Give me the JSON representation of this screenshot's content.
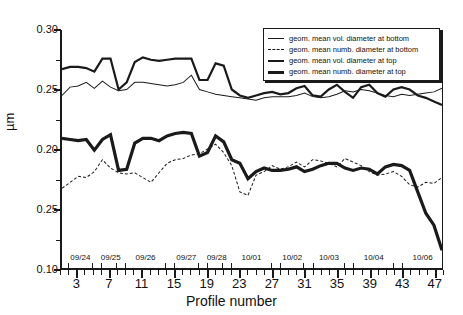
{
  "chart_data": {
    "type": "line",
    "title": "",
    "xlabel": "Profile number",
    "ylabel": "µm",
    "xlim": [
      1,
      48
    ],
    "ylim": [
      0.1,
      0.3
    ],
    "grid": false,
    "legend_position": "top-right",
    "y_ticks": [
      "0.30",
      "0.25",
      "0.20",
      "0.25",
      "0.10"
    ],
    "y_tick_values": [
      0.3,
      0.25,
      0.2,
      0.15,
      0.1
    ],
    "x_ticks": [
      3,
      7,
      11,
      15,
      19,
      23,
      27,
      31,
      35,
      39,
      43,
      47
    ],
    "x": [
      1,
      2,
      3,
      4,
      5,
      6,
      7,
      8,
      9,
      10,
      11,
      12,
      13,
      14,
      15,
      16,
      17,
      18,
      19,
      20,
      21,
      22,
      23,
      24,
      25,
      26,
      27,
      28,
      29,
      30,
      31,
      32,
      33,
      34,
      35,
      36,
      37,
      38,
      39,
      40,
      41,
      42,
      43,
      44,
      45,
      46,
      47,
      48
    ],
    "series": [
      {
        "name": "geom. mean vol. diameter at bottom",
        "style": "thin-solid",
        "color": "#1a1a1a",
        "values": [
          0.245,
          0.252,
          0.253,
          0.256,
          0.251,
          0.257,
          0.252,
          0.249,
          0.25,
          0.256,
          0.256,
          0.255,
          0.254,
          0.253,
          0.254,
          0.256,
          0.262,
          0.25,
          0.248,
          0.246,
          0.245,
          0.244,
          0.243,
          0.242,
          0.241,
          0.243,
          0.244,
          0.244,
          0.244,
          0.245,
          0.247,
          0.244,
          0.243,
          0.244,
          0.246,
          0.249,
          0.248,
          0.25,
          0.249,
          0.247,
          0.245,
          0.244,
          0.246,
          0.245,
          0.246,
          0.247,
          0.248,
          0.251
        ]
      },
      {
        "name": "geom. mean numb. diameter at bottom",
        "style": "thin-dashed",
        "color": "#1a1a1a",
        "values": [
          0.167,
          0.172,
          0.177,
          0.176,
          0.181,
          0.191,
          0.184,
          0.18,
          0.179,
          0.18,
          0.176,
          0.172,
          0.18,
          0.188,
          0.191,
          0.192,
          0.195,
          0.196,
          0.2,
          0.204,
          0.197,
          0.186,
          0.164,
          0.161,
          0.178,
          0.181,
          0.186,
          0.183,
          0.185,
          0.189,
          0.185,
          0.191,
          0.19,
          0.188,
          0.185,
          0.192,
          0.189,
          0.186,
          0.181,
          0.178,
          0.179,
          0.181,
          0.177,
          0.17,
          0.168,
          0.172,
          0.171,
          0.176
        ]
      },
      {
        "name": "geom. mean vol. diameter at top",
        "style": "thick-solid",
        "color": "#1a1a1a",
        "values": [
          0.267,
          0.269,
          0.269,
          0.268,
          0.265,
          0.276,
          0.276,
          0.25,
          0.256,
          0.273,
          0.277,
          0.275,
          0.274,
          0.275,
          0.276,
          0.276,
          0.276,
          0.258,
          0.258,
          0.272,
          0.27,
          0.25,
          0.245,
          0.243,
          0.245,
          0.247,
          0.248,
          0.246,
          0.247,
          0.251,
          0.253,
          0.245,
          0.244,
          0.25,
          0.254,
          0.248,
          0.243,
          0.252,
          0.254,
          0.247,
          0.244,
          0.25,
          0.252,
          0.25,
          0.245,
          0.243,
          0.24,
          0.237
        ]
      },
      {
        "name": "geom. mean numb. diameter at top",
        "style": "thicker-solid",
        "color": "#1a1a1a",
        "values": [
          0.209,
          0.208,
          0.207,
          0.208,
          0.199,
          0.208,
          0.212,
          0.182,
          0.183,
          0.205,
          0.209,
          0.209,
          0.207,
          0.211,
          0.213,
          0.214,
          0.213,
          0.194,
          0.197,
          0.211,
          0.206,
          0.191,
          0.188,
          0.175,
          0.181,
          0.184,
          0.182,
          0.182,
          0.183,
          0.185,
          0.181,
          0.183,
          0.186,
          0.188,
          0.188,
          0.184,
          0.182,
          0.184,
          0.183,
          0.179,
          0.185,
          0.187,
          0.186,
          0.182,
          0.164,
          0.146,
          0.136,
          0.115
        ]
      }
    ],
    "date_brackets": [
      {
        "label": "09/24",
        "start": 2,
        "end": 5
      },
      {
        "label": "09/25",
        "start": 6,
        "end": 8
      },
      {
        "label": "09/26",
        "start": 9,
        "end": 14
      },
      {
        "label": "09/27",
        "start": 15,
        "end": 18
      },
      {
        "label": "09/28",
        "start": 19,
        "end": 21
      },
      {
        "label": "10/01",
        "start": 22,
        "end": 27
      },
      {
        "label": "10/02",
        "start": 28,
        "end": 31
      },
      {
        "label": "10/03",
        "start": 32,
        "end": 36
      },
      {
        "label": "10/04",
        "start": 37,
        "end": 42
      },
      {
        "label": "10/06",
        "start": 43,
        "end": 48
      }
    ]
  }
}
